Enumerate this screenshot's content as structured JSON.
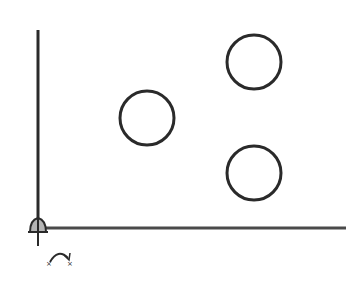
{
  "diagram": {
    "background": "#ffffff",
    "stroke_color": "#2a2a2a",
    "origin_fill": "#b5b5b5",
    "axes": {
      "origin": {
        "x": 38,
        "y": 228
      },
      "x_axis_end": {
        "x": 346,
        "y": 228
      },
      "y_axis_top": {
        "x": 38,
        "y": 30
      }
    },
    "circles": [
      {
        "id": "left",
        "cx": 147,
        "cy": 118,
        "r": 27
      },
      {
        "id": "top-right",
        "cx": 254,
        "cy": 62,
        "r": 27
      },
      {
        "id": "bottom-right",
        "cx": 254,
        "cy": 173,
        "r": 27
      }
    ],
    "icons": {
      "origin_marker": "origin-pin-icon",
      "rotate_marker": "rotate-arrow-icon"
    }
  }
}
